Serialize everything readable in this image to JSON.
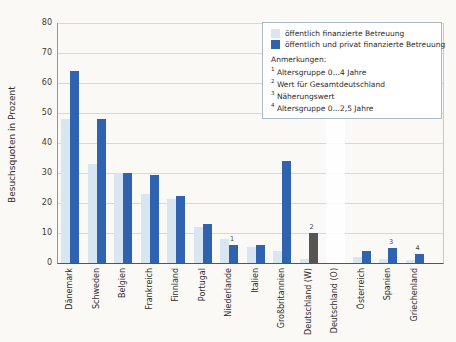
{
  "colors": {
    "bar_light": "#d8e6f2",
    "bar_dark": "#2f63af",
    "bar_gray": "#545454",
    "gridline": "#dbd8d3",
    "legend_border": "#a9bac9",
    "background": "#fbf9f6"
  },
  "y_axis": {
    "title": "Besuchsquoten in Prozent",
    "ticks": [
      0,
      10,
      20,
      30,
      40,
      50,
      60,
      70,
      80
    ]
  },
  "legend": {
    "items": [
      {
        "label": "öffentlich finanzierte Betreuung",
        "color": "#d8e6f2"
      },
      {
        "label": "öffentlich und privat finanzierte Betreuung",
        "color": "#2f63af"
      }
    ],
    "notes_title": "Anmerkungen:",
    "notes": [
      {
        "sup": "1",
        "text": "Altersgruppe 0…4 Jahre"
      },
      {
        "sup": "2",
        "text": "Wert für Gesamtdeutschland"
      },
      {
        "sup": "3",
        "text": "Näherungswert"
      },
      {
        "sup": "4",
        "text": "Altersgruppe 0…2,5 Jahre"
      }
    ]
  },
  "chart_data": {
    "type": "bar",
    "title": "",
    "xlabel": "",
    "ylabel": "Besuchsquoten in Prozent",
    "ylim": [
      0,
      80
    ],
    "ytick_step": 10,
    "grid": true,
    "legend_position": "top-right",
    "categories": [
      "Dänemark",
      "Schweden",
      "Belgien",
      "Frankreich",
      "Finnland",
      "Portugal",
      "Niederlande",
      "Italien",
      "Großbritannien",
      "Deutschland (W)",
      "Deutschland (O)",
      "Österreich",
      "Spanien",
      "Griechenland"
    ],
    "series": [
      {
        "name": "öffentlich finanzierte Betreuung",
        "color": "#d8e6f2",
        "values": [
          48,
          33,
          30,
          23,
          21.5,
          12,
          8,
          5.5,
          4,
          1.5,
          null,
          2,
          1.5,
          1
        ]
      },
      {
        "name": "öffentlich und privat finanzierte Betreuung",
        "color": "#2f63af",
        "values": [
          64,
          48,
          30,
          29.5,
          22.5,
          13,
          6,
          6,
          34,
          10,
          null,
          4,
          5,
          3
        ]
      }
    ],
    "color_overrides": [
      {
        "series_index": 1,
        "category_index": 9,
        "color": "#545454"
      }
    ],
    "note_markers": [
      {
        "category_index": 6,
        "sup": "1"
      },
      {
        "category_index": 9,
        "sup": "2"
      },
      {
        "category_index": 12,
        "sup": "3"
      },
      {
        "category_index": 13,
        "sup": "4"
      }
    ],
    "highlight_band": {
      "category_index": 10,
      "note": "no bars shown for Deutschland (O); column shown as white band"
    }
  }
}
